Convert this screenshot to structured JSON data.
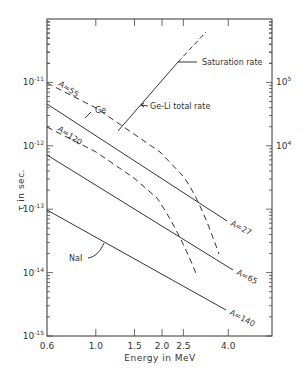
{
  "chart_data": {
    "type": "line",
    "title": "",
    "xlabel": "Energy in MeV",
    "ylabel": "τ in sec.",
    "y2label": "",
    "xscale": "log",
    "yscale": "log",
    "xlim": [
      0.6,
      5.4
    ],
    "ylim": [
      1e-15,
      1e-10
    ],
    "grid": false,
    "legend": "none (inline annotations)",
    "x_ticks": [
      {
        "value": 0.6,
        "label": "0.6"
      },
      {
        "value": 1.0,
        "label": "1.0"
      },
      {
        "value": 1.5,
        "label": "1.5"
      },
      {
        "value": 2.0,
        "label": "2.0"
      },
      {
        "value": 2.5,
        "label": "2.5"
      },
      {
        "value": 4.0,
        "label": "4.0"
      }
    ],
    "y_ticks": [
      {
        "value": 1e-11,
        "base": "10",
        "exp": "-11"
      },
      {
        "value": 1e-12,
        "base": "10",
        "exp": "-12"
      },
      {
        "value": 1e-13,
        "base": "10",
        "exp": "-13"
      },
      {
        "value": 1e-14,
        "base": "10",
        "exp": "-14"
      },
      {
        "value": 1e-15,
        "base": "10",
        "exp": "-15"
      }
    ],
    "y2_ticks": [
      {
        "value": 100000.0,
        "base": "10",
        "exp": "5",
        "aligned_with": 1e-11
      },
      {
        "value": 10000.0,
        "base": "10",
        "exp": "4",
        "aligned_with": 1e-12
      }
    ],
    "series": [
      {
        "name": "A=27",
        "style": "solid",
        "x": [
          0.6,
          4.2
        ],
        "values": [
          4.8e-12,
          6.7e-14
        ],
        "label": "A=27"
      },
      {
        "name": "A=55 (Ge)",
        "style": "dashed",
        "x": [
          0.6,
          1.0,
          1.5,
          2.0,
          2.5,
          3.0,
          3.5,
          3.9
        ],
        "values": [
          1e-11,
          3.9e-12,
          1.6e-12,
          8e-13,
          4.2e-13,
          1.9e-13,
          7e-14,
          2e-14
        ],
        "label": "A=55"
      },
      {
        "name": "A=65",
        "style": "solid",
        "x": [
          0.6,
          4.4
        ],
        "values": [
          7.4e-13,
          1.1e-14
        ],
        "label": "A=65"
      },
      {
        "name": "A=120",
        "style": "dashed",
        "x": [
          0.6,
          1.0,
          1.5,
          2.0,
          2.5,
          2.9
        ],
        "values": [
          4.8e-13,
          1.9e-13,
          7.5e-14,
          3.5e-14,
          1.5e-14,
          9e-15
        ],
        "label": "A=120"
      },
      {
        "name": "A=140 (NaI)",
        "style": "solid",
        "x": [
          0.6,
          4.0
        ],
        "values": [
          1e-13,
          2.6e-15
        ],
        "label": "A=140"
      },
      {
        "name": "Ge-Li total rate",
        "style": "solid-then-dashed",
        "axis": "right",
        "x": [
          1.3,
          2.3,
          3.1
        ],
        "values_px_note": "solid from 1.3 to 2.3 MeV, dashed beyond saturation",
        "values": [
          1.1e-12,
          9e-12,
          2.6e-11
        ]
      }
    ],
    "annotations": [
      "Saturation rate",
      "Ge-Li total rate",
      "Ge",
      "NaI",
      "A=55",
      "A=120",
      "A=27",
      "A=65",
      "A=140"
    ]
  },
  "labels": {
    "xlabel": "Energy in MeV",
    "ylabel": "τ in sec.",
    "saturation": "Saturation rate",
    "geli": "Ge-Li total rate",
    "ge": "Ge",
    "nai": "NaI",
    "a55": "A=55",
    "a120": "A=120",
    "a27": "A=27",
    "a65": "A=65",
    "a140": "A=140"
  },
  "colors": {
    "ink": "#333333",
    "background": "#ffffff"
  }
}
